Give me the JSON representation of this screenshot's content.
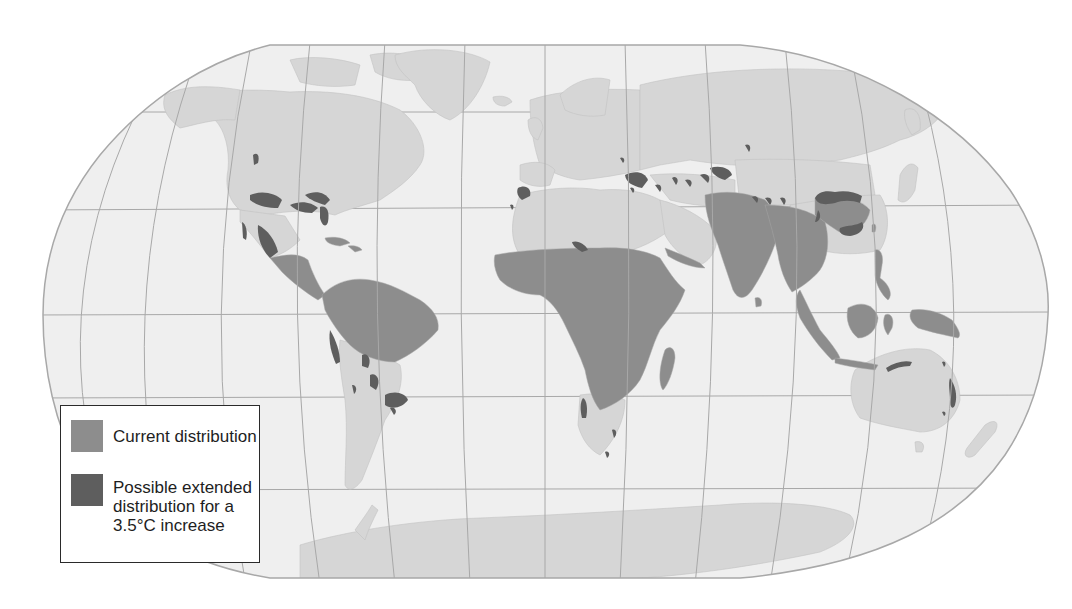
{
  "map": {
    "projection": "Robinson",
    "colors": {
      "ocean": "#efefef",
      "land": "#d6d6d6",
      "current_distribution": "#8d8d8d",
      "extended_distribution": "#5e5e5e",
      "graticule": "#a8a8a8",
      "border": "#b8b8b8"
    },
    "regions_current_distribution": [
      "Sub-Saharan Africa",
      "Madagascar",
      "Amazon basin / northern South America",
      "Central America and southern Mexico",
      "Caribbean",
      "India and South Asia",
      "Southeast Asia",
      "Southern China",
      "Indonesia",
      "Philippines",
      "New Guinea",
      "Arabian peninsula coast"
    ],
    "regions_extended_distribution": [
      "Southern United States",
      "Northern Mexico",
      "Southern Brazil",
      "Andes foothills",
      "Southern Africa",
      "Mediterranean / Turkey",
      "Caucasus and Central Asia",
      "Himalayan foothills",
      "Central China",
      "Northern Australia",
      "Eastern Australia",
      "North Africa coast"
    ]
  },
  "legend": {
    "items": [
      {
        "label": "Current distribution",
        "color": "#8d8d8d"
      },
      {
        "label": "Possible extended\ndistribution for a\n3.5°C increase",
        "color": "#5e5e5e"
      }
    ]
  }
}
